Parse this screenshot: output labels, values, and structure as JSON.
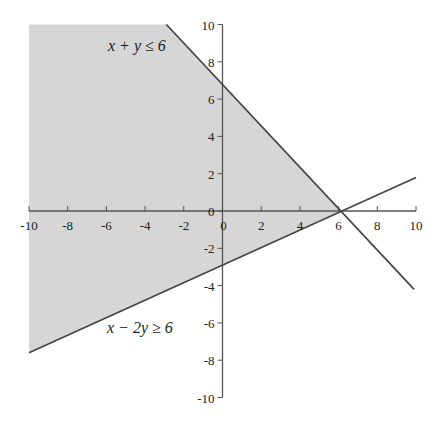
{
  "chart_data": {
    "type": "line",
    "title": "",
    "xlabel": "",
    "ylabel": "",
    "xlim": [
      -10,
      10
    ],
    "ylim": [
      -10,
      10
    ],
    "grid": false,
    "x_ticks": [
      -10,
      -8,
      -6,
      -4,
      -2,
      0,
      2,
      4,
      6,
      8,
      10
    ],
    "y_ticks": [
      10,
      8,
      6,
      4,
      2,
      0,
      -2,
      -4,
      -6,
      -8,
      -10
    ],
    "series": [
      {
        "name": "x + y = 6",
        "x": [
          -2.9,
          9.9
        ],
        "y": [
          10,
          -4.2
        ]
      },
      {
        "name": "x - 2y = 6",
        "x": [
          -10,
          10
        ],
        "y": [
          -7.6,
          1.8
        ]
      }
    ],
    "shaded_region": {
      "description": "feasible region x + y ≤ 6 and x - 2y ≥ 6 (as shaded)",
      "vertices": [
        [
          -10,
          10
        ],
        [
          -2.9,
          10
        ],
        [
          6.1,
          0
        ],
        [
          -10,
          -7.6
        ]
      ],
      "color": "#d6d6d6"
    },
    "annotations": [
      {
        "text": "x + y ≤ 6",
        "x": -3.5,
        "y": 8.6
      },
      {
        "text": "x − 2y ≥ 6",
        "x": -3.5,
        "y": -6.3
      }
    ]
  },
  "labels": {
    "upper": "x + y ≤ 6",
    "lower": "x − 2y ≥ 6"
  },
  "colors": {
    "shade": "#d6d6d6",
    "line": "#444444",
    "axis": "#555555"
  }
}
